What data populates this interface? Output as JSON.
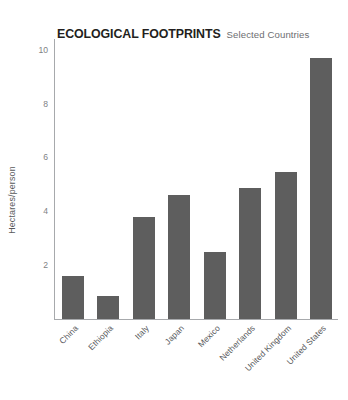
{
  "chart_data": {
    "type": "bar",
    "title": "ECOLOGICAL FOOTPRINTS",
    "subtitle": "Selected Countries",
    "xlabel": "",
    "ylabel": "Hectares/person",
    "ylim": [
      0,
      10.4
    ],
    "yticks": [
      2,
      4,
      6,
      8,
      10
    ],
    "ytick_labels": [
      "2",
      "4",
      "6",
      "8",
      "10"
    ],
    "grid": false,
    "legend": false,
    "bar_color": "#5e5e5e",
    "axis_color": "#a7a9ac",
    "categories": [
      "China",
      "Ethiopia",
      "Italy",
      "Japan",
      "Mexico",
      "Netherlands",
      "United Kingdom",
      "United States"
    ],
    "values": [
      1.6,
      0.85,
      3.8,
      4.6,
      2.5,
      4.85,
      5.45,
      9.7
    ]
  }
}
